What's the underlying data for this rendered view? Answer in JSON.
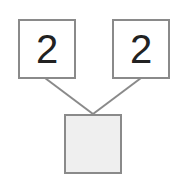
{
  "diagram": {
    "type": "number-bond",
    "parts": [
      {
        "label": "2"
      },
      {
        "label": "2"
      }
    ],
    "whole": {
      "label": ""
    },
    "colors": {
      "border": "#8a8a8a",
      "connector": "#8a8a8a",
      "whole_fill": "#efefef",
      "text": "#222222"
    }
  }
}
